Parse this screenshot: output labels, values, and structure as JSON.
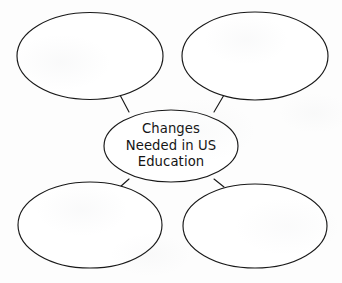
{
  "document": {
    "type": "concept-web-graphic-organizer",
    "background_color": "#fdfdfd",
    "stroke_color": "#191919",
    "fill_color": "#ffffff",
    "text_color": "#141414"
  },
  "center_node": {
    "name": "center-topic",
    "text": "Changes Needed in US Education",
    "lines": [
      "Changes",
      "Needed in US",
      "Education"
    ],
    "shape": "ellipse",
    "cx": 171,
    "cy": 146,
    "rx": 67,
    "ry": 36
  },
  "satellite_nodes": [
    {
      "name": "top-left-blank-ellipse",
      "position": "top-left",
      "text": "",
      "shape": "ellipse",
      "cx": 90,
      "cy": 56,
      "rx": 73,
      "ry": 43.5
    },
    {
      "name": "top-right-blank-ellipse",
      "position": "top-right",
      "text": "",
      "shape": "ellipse",
      "cx": 255,
      "cy": 56,
      "rx": 73,
      "ry": 44
    },
    {
      "name": "bottom-left-blank-ellipse",
      "position": "bottom-left",
      "text": "",
      "shape": "ellipse",
      "cx": 90,
      "cy": 225,
      "rx": 72,
      "ry": 43
    },
    {
      "name": "bottom-right-blank-ellipse",
      "position": "bottom-right",
      "text": "",
      "shape": "ellipse",
      "cx": 255,
      "cy": 226,
      "rx": 72,
      "ry": 42
    }
  ],
  "connectors": [
    {
      "name": "connector-center-to-top-left",
      "x1": 120,
      "y1": 95,
      "x2": 129,
      "y2": 112
    },
    {
      "name": "connector-center-to-top-right",
      "x1": 224,
      "y1": 95,
      "x2": 214,
      "y2": 112
    },
    {
      "name": "connector-center-to-bottom-left",
      "x1": 120,
      "y1": 187,
      "x2": 129,
      "y2": 179
    },
    {
      "name": "connector-center-to-bottom-right",
      "x1": 224,
      "y1": 187,
      "x2": 214,
      "y2": 179
    }
  ]
}
